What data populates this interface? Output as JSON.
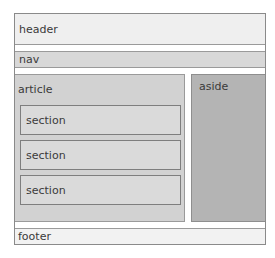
{
  "diagram": {
    "title": "",
    "type": "html5-semantic-layout",
    "regions": {
      "header": {
        "label": "header",
        "color": "#efefef"
      },
      "nav": {
        "label": "nav",
        "color": "#d8d8d8"
      },
      "article": {
        "label": "article",
        "color": "#d2d2d2"
      },
      "sections": [
        {
          "label": "section",
          "color": "#dadada"
        },
        {
          "label": "section",
          "color": "#dadada"
        },
        {
          "label": "section",
          "color": "#dadada"
        }
      ],
      "aside": {
        "label": "aside",
        "color": "#b4b4b4"
      },
      "footer": {
        "label": "footer",
        "color": "#f2f2f2"
      }
    }
  }
}
